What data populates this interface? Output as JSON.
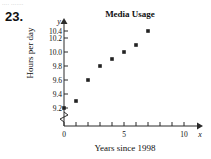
{
  "page": {
    "exercise_number": "23.",
    "top_bleed_text": "....  ......."
  },
  "chart_data": {
    "type": "scatter",
    "title": "Media Usage",
    "xlabel": "Years since 1998",
    "ylabel": "Hours per day",
    "x_var": "x",
    "y_var": "y",
    "xlim": [
      0,
      11
    ],
    "ylim": [
      9.1,
      10.5
    ],
    "y_axis_break": true,
    "grid": false,
    "legend": null,
    "x_tick_labels": [
      "0",
      "5",
      "10"
    ],
    "x_tick_values": [
      0,
      5,
      10
    ],
    "x_minor_tick_values": [
      1,
      2,
      3,
      4,
      6,
      7,
      8,
      9
    ],
    "y_tick_labels": [
      "9.2",
      "9.4",
      "9.6",
      "9.8",
      "10.0",
      "10.2",
      "10.4"
    ],
    "y_tick_values": [
      9.2,
      9.4,
      9.6,
      9.8,
      10.0,
      10.2,
      10.4
    ],
    "x": [
      0,
      1,
      2,
      3,
      4,
      5,
      6,
      7
    ],
    "values": [
      9.2,
      9.3,
      9.6,
      9.8,
      9.9,
      10.0,
      10.1,
      10.3
    ],
    "points": [
      {
        "x": 0,
        "y": 9.2
      },
      {
        "x": 1,
        "y": 9.3
      },
      {
        "x": 2,
        "y": 9.6
      },
      {
        "x": 3,
        "y": 9.8
      },
      {
        "x": 4,
        "y": 9.9
      },
      {
        "x": 5,
        "y": 10.0
      },
      {
        "x": 6,
        "y": 10.1
      },
      {
        "x": 7,
        "y": 10.3
      }
    ],
    "marker": "square",
    "marker_color": "#222222",
    "axis_color": "#2b2b2b"
  }
}
